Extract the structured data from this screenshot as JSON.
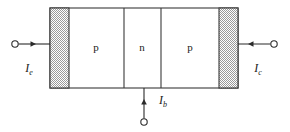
{
  "figure": {
    "type": "device-cross-section",
    "background_color": "#ffffff",
    "line_color": "#2b2b2b",
    "outline_color": "#3a3a3a",
    "contact_fill_color": "#b8b8b8",
    "region_fill_color": "#ffffff"
  },
  "device": {
    "body": {
      "x": 50,
      "y": 8,
      "width": 188,
      "height": 80
    },
    "contacts": [
      {
        "name": "emitter-contact",
        "x": 50,
        "y": 8,
        "width": 19,
        "height": 80,
        "pattern": "stipple"
      },
      {
        "name": "collector-contact",
        "x": 219,
        "y": 8,
        "width": 19,
        "height": 80,
        "pattern": "stipple"
      }
    ],
    "dividers": [
      {
        "name": "emitter-base-junction",
        "x": 124
      },
      {
        "name": "base-collector-junction",
        "x": 161
      }
    ],
    "regions": [
      {
        "id": "emitter",
        "label": "p",
        "cx": 96,
        "cy": 48
      },
      {
        "id": "base",
        "label": "n",
        "cx": 142,
        "cy": 48
      },
      {
        "id": "collector",
        "label": "p",
        "cx": 190,
        "cy": 48
      }
    ]
  },
  "terminals": [
    {
      "id": "emitter-terminal",
      "symbol": "I",
      "subscript": "e",
      "label_x": 29,
      "label_y": 72,
      "node_cx": 15,
      "node_cy": 44,
      "node_r": 3.2,
      "lead": {
        "x1": 18.5,
        "y1": 44,
        "x2": 50,
        "y2": 44
      },
      "arrow_direction": "right",
      "arrow_x": 36,
      "arrow_y": 44
    },
    {
      "id": "collector-terminal",
      "symbol": "I",
      "subscript": "c",
      "label_x": 258,
      "label_y": 72,
      "node_cx": 274,
      "node_cy": 44,
      "node_r": 3.2,
      "lead": {
        "x1": 238,
        "y1": 44,
        "x2": 270.5,
        "y2": 44
      },
      "arrow_direction": "left",
      "arrow_x": 252,
      "arrow_y": 44
    },
    {
      "id": "base-terminal",
      "symbol": "I",
      "subscript": "b",
      "label_x": 163,
      "label_y": 104,
      "node_cx": 144,
      "node_cy": 122,
      "node_r": 3.2,
      "lead": {
        "x1": 144,
        "y1": 88,
        "x2": 144,
        "y2": 118.5
      },
      "arrow_direction": "up",
      "arrow_x": 144,
      "arrow_y": 102
    }
  ]
}
